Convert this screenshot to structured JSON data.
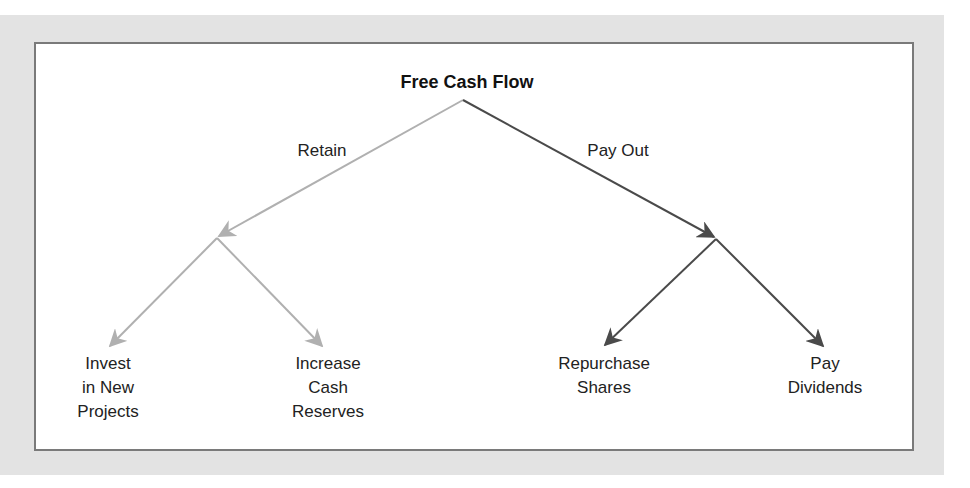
{
  "diagram": {
    "root": {
      "label": "Free Cash Flow"
    },
    "branches": [
      {
        "edge_label": "Retain",
        "color": "#b0b0b0",
        "children": [
          {
            "label": "Invest\nin New\nProjects"
          },
          {
            "label": "Increase\nCash\nReserves"
          }
        ]
      },
      {
        "edge_label": "Pay Out",
        "color": "#4a4a4a",
        "children": [
          {
            "label": "Repurchase\nShares"
          },
          {
            "label": "Pay\nDividends"
          }
        ]
      }
    ]
  },
  "colors": {
    "background": "#e3e3e3",
    "panel": "#ffffff",
    "panel_border": "#7a7a7a",
    "retain_line": "#b0b0b0",
    "payout_line": "#4a4a4a"
  }
}
